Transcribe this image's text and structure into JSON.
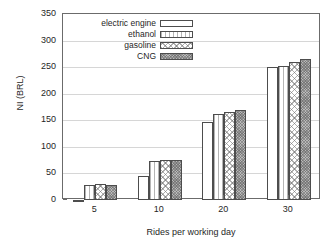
{
  "chart_data": {
    "type": "bar",
    "title": "",
    "xlabel": "Rides per working day",
    "ylabel": "NI (BRL)",
    "categories": [
      "5",
      "10",
      "20",
      "30"
    ],
    "ylim": [
      0,
      350
    ],
    "yticks": [
      0,
      50,
      100,
      150,
      200,
      250,
      300,
      350
    ],
    "grid": true,
    "legend_position": "top-left-inside",
    "series": [
      {
        "name": "electric engine",
        "pattern": "empty",
        "values": [
          -4,
          46,
          147,
          250
        ]
      },
      {
        "name": "ethanol",
        "pattern": "hatch",
        "values": [
          29,
          74,
          161,
          253
        ]
      },
      {
        "name": "gasoline",
        "pattern": "cross",
        "values": [
          31,
          76,
          166,
          260
        ]
      },
      {
        "name": "CNG",
        "pattern": "dense",
        "values": [
          28,
          76,
          170,
          266
        ]
      }
    ]
  },
  "axes": {
    "y_tick_labels": [
      "0",
      "50",
      "100",
      "150",
      "200",
      "250",
      "300",
      "350"
    ],
    "x_tick_labels": [
      "5",
      "10",
      "20",
      "30"
    ],
    "y_axis_title": "NI (BRL)",
    "x_axis_title": "Rides per working day"
  },
  "legend": {
    "entries": [
      {
        "label": "electric engine"
      },
      {
        "label": "ethanol"
      },
      {
        "label": "gasoline"
      },
      {
        "label": "CNG"
      }
    ]
  },
  "colors": {
    "frame": "#6b6b6b",
    "grid": "#d6d6d6",
    "bar_outline": "#4d4d4d",
    "cng_fill": "#b9b9b9",
    "text": "#1f1f1f",
    "background": "#ffffff"
  }
}
